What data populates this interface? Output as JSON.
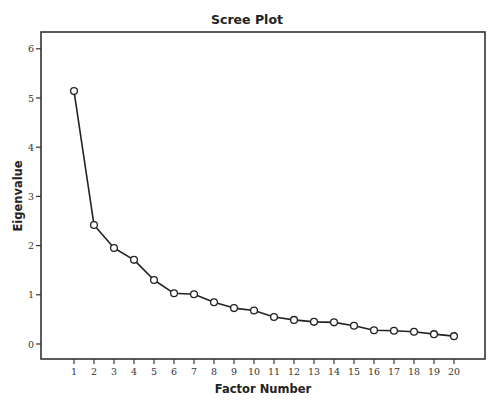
{
  "chart_data": {
    "type": "line",
    "title": "Scree Plot",
    "xlabel": "Factor Number",
    "ylabel": "Eigenvalue",
    "categories": [
      1,
      2,
      3,
      4,
      5,
      6,
      7,
      8,
      9,
      10,
      11,
      12,
      13,
      14,
      15,
      16,
      17,
      18,
      19,
      20
    ],
    "series": [
      {
        "name": "Eigenvalue",
        "values": [
          5.14,
          2.42,
          1.95,
          1.71,
          1.3,
          1.03,
          1.01,
          0.85,
          0.73,
          0.68,
          0.55,
          0.49,
          0.45,
          0.44,
          0.37,
          0.28,
          0.27,
          0.25,
          0.2,
          0.16
        ],
        "marker": "open-circle",
        "color": "#222222"
      }
    ],
    "xticks": [
      "1",
      "2",
      "3",
      "4",
      "5",
      "6",
      "7",
      "8",
      "9",
      "10",
      "11",
      "12",
      "13",
      "14",
      "15",
      "16",
      "17",
      "18",
      "19",
      "20"
    ],
    "yticks": [
      "0",
      "1",
      "2",
      "3",
      "4",
      "5",
      "6"
    ],
    "ylim": [
      0,
      6
    ],
    "grid": false,
    "legend": "none"
  }
}
